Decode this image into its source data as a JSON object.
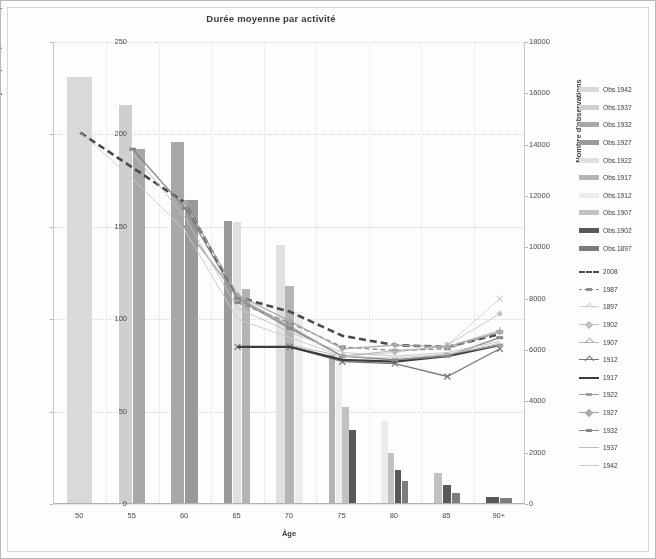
{
  "chart": {
    "title": "Durée moyenne par activité",
    "x_axis_title": "Âge",
    "y_left_title": "Durée moyenne par déplacement (min)",
    "y_right_title": "Nombre d'observations"
  },
  "chart_data": {
    "type": "bar",
    "title": "Durée moyenne par activité",
    "xlabel": "Âge",
    "ylabel": "Durée moyenne par déplacement (min)",
    "y2label": "Nombre d'observations",
    "grid": true,
    "legend_position": "right",
    "categories": [
      "50",
      "55",
      "60",
      "65",
      "70",
      "75",
      "80",
      "85",
      "90+"
    ],
    "ylim": [
      0,
      250
    ],
    "yticks": [
      0,
      50,
      100,
      150,
      200,
      250
    ],
    "y2lim": [
      0,
      18000
    ],
    "y2ticks": [
      0,
      2000,
      4000,
      6000,
      8000,
      10000,
      12000,
      14000,
      16000,
      18000
    ],
    "bar_series": [
      {
        "name": "Obs.1942",
        "axis": "right",
        "color": "#d9d9d9",
        "values": [
          16600,
          0,
          0,
          0,
          0,
          0,
          0,
          0,
          0
        ]
      },
      {
        "name": "Obs.1937",
        "axis": "right",
        "color": "#cfcfcf",
        "values": [
          0,
          15500,
          0,
          0,
          0,
          0,
          0,
          0,
          0
        ]
      },
      {
        "name": "Obs.1932",
        "axis": "right",
        "color": "#a8a8a8",
        "values": [
          0,
          13800,
          14050,
          0,
          0,
          0,
          0,
          0,
          0
        ]
      },
      {
        "name": "Obs.1927",
        "axis": "right",
        "color": "#9a9a9a",
        "values": [
          0,
          0,
          11800,
          11000,
          0,
          0,
          0,
          0,
          0
        ]
      },
      {
        "name": "Obs.1922",
        "axis": "right",
        "color": "#e0e0e0",
        "values": [
          0,
          0,
          0,
          10950,
          10050,
          0,
          0,
          0,
          0
        ]
      },
      {
        "name": "Obs.1917",
        "axis": "right",
        "color": "#b4b4b4",
        "values": [
          0,
          0,
          0,
          8350,
          8450,
          5750,
          0,
          0,
          0
        ]
      },
      {
        "name": "Obs.1912",
        "axis": "right",
        "color": "#ececec",
        "values": [
          0,
          0,
          0,
          0,
          7450,
          5500,
          3200,
          0,
          0
        ]
      },
      {
        "name": "Obs.1907",
        "axis": "right",
        "color": "#c2c2c2",
        "values": [
          0,
          0,
          0,
          0,
          0,
          3750,
          1950,
          1150,
          0
        ]
      },
      {
        "name": "Obs.1902",
        "axis": "right",
        "color": "#585858",
        "values": [
          0,
          0,
          0,
          0,
          0,
          2850,
          1300,
          700,
          250
        ]
      },
      {
        "name": "Obs.1897",
        "axis": "right",
        "color": "#7d7d7d",
        "values": [
          0,
          0,
          0,
          0,
          0,
          0,
          850,
          400,
          180
        ]
      }
    ],
    "line_series": [
      {
        "name": "2008",
        "axis": "left",
        "color": "#4a4a4a",
        "style": "dashed-thick",
        "marker": "none",
        "values": [
          201,
          182,
          163,
          112,
          104,
          91,
          86,
          85,
          92
        ]
      },
      {
        "name": "1987",
        "axis": "left",
        "color": "#8a8a8a",
        "style": "dashed",
        "marker": "dash",
        "values": [
          null,
          null,
          null,
          109,
          98,
          85,
          83,
          84,
          93
        ]
      },
      {
        "name": "1897",
        "axis": "left",
        "color": "#d0d0d0",
        "style": "solid-thin",
        "marker": "x",
        "values": [
          null,
          null,
          null,
          null,
          null,
          null,
          null,
          86,
          111
        ]
      },
      {
        "name": "1902",
        "axis": "left",
        "color": "#c2c2c2",
        "style": "solid-thin",
        "marker": "diamond",
        "values": [
          null,
          null,
          null,
          null,
          null,
          80,
          82,
          86,
          103
        ]
      },
      {
        "name": "1907",
        "axis": "left",
        "color": "#b0b0b0",
        "style": "solid-thin",
        "marker": "cross",
        "values": [
          null,
          null,
          null,
          null,
          86,
          80,
          83,
          85,
          94
        ]
      },
      {
        "name": "1912",
        "axis": "left",
        "color": "#777777",
        "style": "solid",
        "marker": "x",
        "values": [
          null,
          null,
          null,
          85,
          85,
          77,
          76,
          69,
          84
        ]
      },
      {
        "name": "1917",
        "axis": "left",
        "color": "#3d3d3d",
        "style": "solid-thick",
        "marker": "none",
        "values": [
          null,
          null,
          null,
          85,
          85,
          78,
          77,
          80,
          86
        ]
      },
      {
        "name": "1922",
        "axis": "left",
        "color": "#9e9e9e",
        "style": "solid",
        "marker": "dash",
        "values": [
          null,
          null,
          150,
          112,
          96,
          80,
          78,
          81,
          86
        ]
      },
      {
        "name": "1927",
        "axis": "left",
        "color": "#a9a9a9",
        "style": "solid",
        "marker": "diamond",
        "values": [
          null,
          null,
          163,
          113,
          99,
          84,
          86,
          85,
          93
        ]
      },
      {
        "name": "1932",
        "axis": "left",
        "color": "#888888",
        "style": "solid",
        "marker": "dash",
        "values": [
          null,
          192,
          160,
          111,
          95,
          80,
          78,
          80,
          90
        ]
      },
      {
        "name": "1937",
        "axis": "left",
        "color": "#bfbfbf",
        "style": "solid-thin",
        "marker": "none",
        "values": [
          null,
          190,
          155,
          106,
          93,
          82,
          80,
          82,
          88
        ]
      },
      {
        "name": "1942",
        "axis": "left",
        "color": "#cccccc",
        "style": "solid-thin",
        "marker": "none",
        "values": [
          201,
          176,
          148,
          100,
          90,
          80,
          79,
          81,
          87
        ]
      }
    ]
  },
  "legend": {
    "bars": [
      {
        "label": "Obs.1942"
      },
      {
        "label": "Obs.1937"
      },
      {
        "label": "Obs.1932"
      },
      {
        "label": "Obs.1927"
      },
      {
        "label": "Obs.1922"
      },
      {
        "label": "Obs.1917"
      },
      {
        "label": "Obs.1912"
      },
      {
        "label": "Obs.1907"
      },
      {
        "label": "Obs.1902"
      },
      {
        "label": "Obs.1897"
      }
    ],
    "lines": [
      {
        "label": "2008"
      },
      {
        "label": "1987"
      },
      {
        "label": "1897"
      },
      {
        "label": "1902"
      },
      {
        "label": "1907"
      },
      {
        "label": "1912"
      },
      {
        "label": "1917"
      },
      {
        "label": "1922"
      },
      {
        "label": "1927"
      },
      {
        "label": "1932"
      },
      {
        "label": "1937"
      },
      {
        "label": "1942"
      }
    ]
  }
}
